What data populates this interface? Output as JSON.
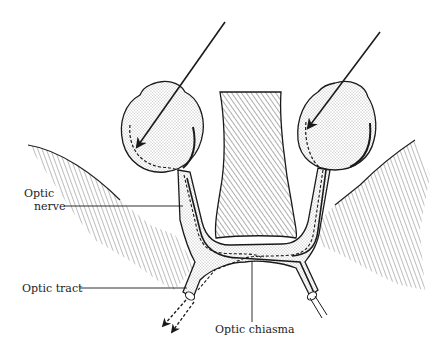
{
  "diagram": {
    "labels": {
      "optic_nerve_line1": "Optic",
      "optic_nerve_line2": "nerve",
      "optic_tract": "Optic tract",
      "optic_chiasma": "Optic chiasma"
    },
    "colors": {
      "ink": "#1a1a1a",
      "stipple": "#c8c8c8",
      "background": "#ffffff"
    }
  }
}
